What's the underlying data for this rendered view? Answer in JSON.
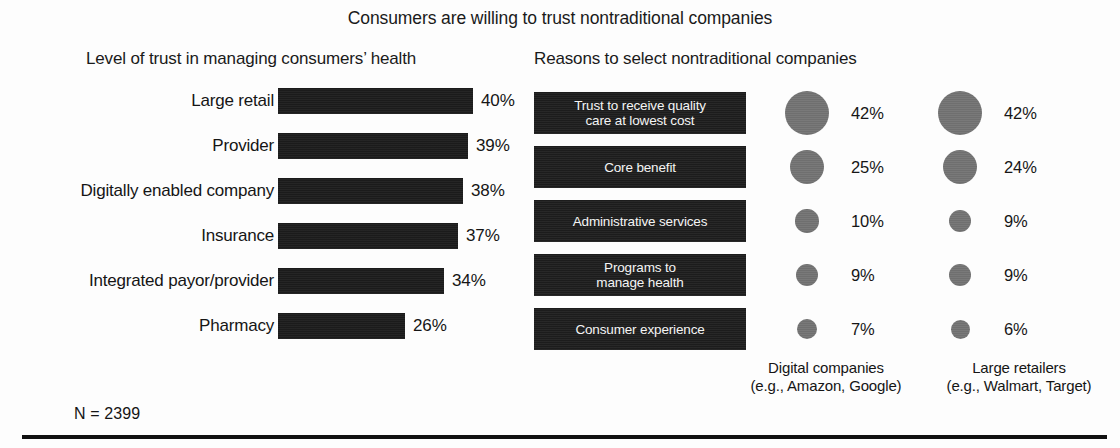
{
  "title": "Consumers are willing to trust nontraditional companies",
  "left_panel": {
    "title": "Level of trust in managing consumers’ health"
  },
  "right_panel": {
    "title": "Reasons to select nontraditional companies"
  },
  "footnote": "N = 2399",
  "legend": [
    {
      "name": "Digital companies",
      "examples": "(e.g., Amazon, Google)"
    },
    {
      "name": "Large retailers",
      "examples": "(e.g., Walmart, Target)"
    }
  ],
  "colors": {
    "bar": "#1b1b1b",
    "box": "#1c1c1c",
    "bubble": "#6f6f6f",
    "text": "#151515",
    "box_text": "#f4f4f4",
    "background": "#fdfdfd",
    "rule": "#111111"
  },
  "chart_data": [
    {
      "type": "bar",
      "title": "Level of trust in managing consumers’ health",
      "orientation": "horizontal",
      "xlabel": "",
      "ylabel": "",
      "grid": false,
      "value_labels": [
        "40%",
        "39%",
        "38%",
        "37%",
        "34%",
        "26%"
      ],
      "categories": [
        "Large retail",
        "Provider",
        "Digitally enabled company",
        "Insurance",
        "Integrated payor/provider",
        "Pharmacy"
      ],
      "values": [
        40,
        39,
        38,
        37,
        34,
        26
      ],
      "unit": "%",
      "xlim": [
        0,
        40
      ]
    },
    {
      "type": "bubble",
      "title": "Reasons to select nontraditional companies",
      "categories": [
        "Trust to receive quality\ncare at lowest cost",
        "Core benefit",
        "Administrative services",
        "Programs to\nmanage health",
        "Consumer experience"
      ],
      "legend_position": "bottom",
      "unit": "%",
      "series": [
        {
          "name": "Digital companies",
          "examples": "(e.g., Amazon, Google)",
          "values": [
            42,
            25,
            10,
            9,
            7
          ],
          "labels": [
            "42%",
            "25%",
            "10%",
            "9%",
            "7%"
          ]
        },
        {
          "name": "Large retailers",
          "examples": "(e.g., Walmart, Target)",
          "values": [
            42,
            24,
            9,
            9,
            6
          ],
          "labels": [
            "42%",
            "24%",
            "9%",
            "9%",
            "6%"
          ]
        }
      ]
    }
  ]
}
